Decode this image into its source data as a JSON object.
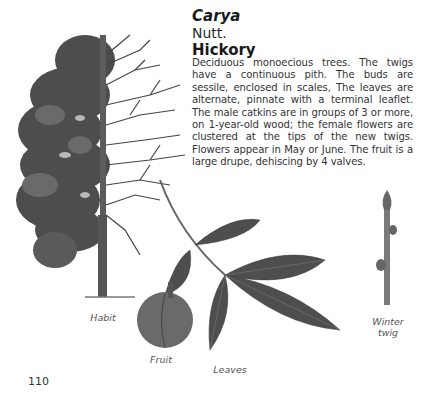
{
  "entry": {
    "genus": "Carya",
    "author": "Nutt.",
    "common_name": "Hickory",
    "description": "Deciduous monoecious trees. The twigs have a continuous pith. The buds are sessile, enclosed in scales, The leaves are alternate, pinnate with a terminal leaflet. The male catkins are in groups of 3 or more, on 1-year-old wood; the female flowers are clustered at the tips of the new twigs. Flowers appear in May or June. The fruit is a large drupe, dehiscing by 4 valves."
  },
  "illustrations": {
    "habit": {
      "caption": "Habit",
      "icon": "tree-half-leafed-half-bare-icon"
    },
    "fruit": {
      "caption": "Fruit",
      "icon": "hickory-nut-icon"
    },
    "leaves": {
      "caption": "Leaves",
      "icon": "pinnate-leaf-icon"
    },
    "winter_twig": {
      "caption_line1": "Winter",
      "caption_line2": "twig",
      "icon": "winter-twig-icon"
    }
  },
  "page": {
    "number": "110"
  },
  "colors": {
    "ink": "#1a1a1a",
    "foliage": "#4a4a4a",
    "caption": "#555555",
    "background": "#ffffff"
  }
}
